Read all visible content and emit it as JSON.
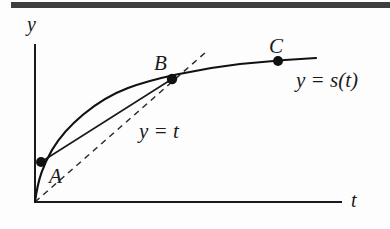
{
  "figure": {
    "kind": "math-diagram",
    "background_color": "#fdfdfd",
    "ink_color": "#1a1a1a",
    "axes": {
      "y_axis_label": "y",
      "t_axis_label": "t",
      "origin": {
        "x": 35,
        "y": 202
      },
      "y_axis_top": {
        "x": 35,
        "y": 45
      },
      "t_axis_right": {
        "x": 341,
        "y": 202
      }
    },
    "curve": {
      "name": "y = s(t)",
      "label": "y = s(t)",
      "label_position": {
        "x": 296,
        "y": 70
      },
      "path": "M 35 202 C 38 178, 44 164, 52 150 C 66 126, 96 100, 128 88 C 152 79, 196 69, 240 64 C 268 61, 296 59, 316 58",
      "stroke_width": 2.2
    },
    "secant": {
      "name": "chord-A-B",
      "from": {
        "x": 41,
        "y": 162
      },
      "to": {
        "x": 172,
        "y": 79
      },
      "stroke_width": 1.6
    },
    "dashed_line": {
      "name": "y = t",
      "label": "y = t",
      "label_position": {
        "x": 139,
        "y": 121
      },
      "from": {
        "x": 35,
        "y": 202
      },
      "to": {
        "x": 206,
        "y": 52
      },
      "dash_pattern": "6 5",
      "stroke_width": 1.5
    },
    "points": [
      {
        "id": "A",
        "label": "A",
        "cx": 41,
        "cy": 162,
        "r": 5.0,
        "label_x": 49,
        "label_y": 166
      },
      {
        "id": "B",
        "label": "B",
        "cx": 172,
        "cy": 79,
        "r": 5.2,
        "label_x": 154,
        "label_y": 53
      },
      {
        "id": "C",
        "label": "C",
        "cx": 278,
        "cy": 61,
        "r": 5.0,
        "label_x": 269,
        "label_y": 36
      }
    ],
    "scan_artifacts": {
      "top_bar": {
        "x": 11,
        "y": 2,
        "width": 379,
        "height": 6
      },
      "ghost_line": "",
      "note": "dark scan edge bar across top of page"
    }
  }
}
